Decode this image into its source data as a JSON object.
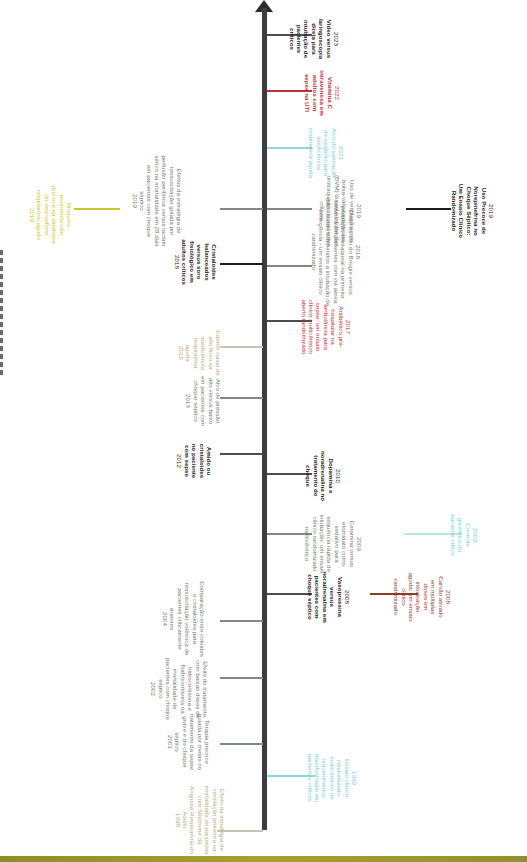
{
  "title_strip": "Linha do tempo (texto parcialmente cortado na margem esquerda)",
  "colors": {
    "axis": "#3d3d3f",
    "black_entry": "#1e1e22",
    "gray_entry": "#6f7a72",
    "yellow_entry": "#c9c72a",
    "cyan_entry": "#6fcfd3",
    "red_entry": "#c0303a",
    "brown_entry": "#8a3b2a",
    "tan_entry": "#b5ac7e",
    "footer_band": "#9a9a30"
  },
  "timeline": {
    "above": [
      {
        "year": "1998",
        "text": "Efeito da estratégia de ventilação protetora na mortalidade de pacientes com Síndrome da Angústia Respiratória do Adulto",
        "color": "tan"
      },
      {
        "year": "2001",
        "text": "Terapia precoce guiada por metas no tratamento da sepse grave e do choque séptico",
        "color": "gray"
      },
      {
        "year": "2002",
        "text": "Efeito do tratamento com baixas doses de hidrocortisona e fludrocortisona na mortalidade de pacientes com choque séptico",
        "color": "gray"
      },
      {
        "year": "2004",
        "text": "Comparação entre coloides e cristaloides para ressuscitação volêmica de pacientes criticamente doentes",
        "color": "gray"
      },
      {
        "year": "2012",
        "text": "Amido ou cristaloides no paciente com sepse",
        "color": "black"
      },
      {
        "year": "2014",
        "text": "Alvo de pressão alto versus baixo em pacientes com choque séptico",
        "color": "gray"
      },
      {
        "year": "2015",
        "text": "Cateter nasal de alto fluxo na insuficiência respiratória aguda",
        "color": "tan"
      },
      {
        "year": "2018",
        "text": "Cristaloides balanceados versus soro fisiológico em adultos críticos",
        "color": "black"
      },
      {
        "year": "2019",
        "text": "Efeitos da estratégia de ressuscitação guiada por perfusão periférica versus lactato sérico na mortalidade em 28 dias em pacientes com choque séptico",
        "color": "gray"
      },
      {
        "year": "2019",
        "text": "Bloqueio neuromuscular precoce na síndrome do desconforto respiratório agudo",
        "color": "yellow"
      }
    ],
    "below": [
      {
        "year": "1999",
        "text": "Ensaio clínico randomizado multicêntrico de requerimentos transfusionais em pacientes críticos",
        "color": "cyan"
      },
      {
        "year": "2008",
        "text": "Vasopressina versus noradrenalina em pacientes com choque séptico",
        "color": "black"
      },
      {
        "year": "2008",
        "text": "Carvão ativado em múltiplas doses em intoxicação aguda: um ensaio clínico randomizado",
        "color": "brown"
      },
      {
        "year": "2009",
        "text": "Cetamina versus etomidato como sedativo para sequência rápida de intubação: um ensaio clínico randomizado multicêntrico",
        "color": "gray"
      },
      {
        "year": "2009",
        "text": "Controle glicêmico do paciente crítico",
        "color": "cyan"
      },
      {
        "year": "2010",
        "text": "Dopamina e noradrenalina no tratamento do choque",
        "color": "black"
      },
      {
        "year": "2017",
        "text": "Antibiótico pré-hospitalar na ambulância para sepse: um ensaio clínico multicêntrico aberto randomizado",
        "color": "red"
      },
      {
        "year": "2018",
        "text": "Efeito do uso do Bougie versus intubação orotraqueal na primeira tentativa em pacientes com via aérea difícil sendo submetidos a intubação de emergência - um ensaio clínico randomizado",
        "color": "gray"
      },
      {
        "year": "2019",
        "text": "Uso de ventilação com bolsa-válvula-máscara (BVM) durante intubações orotraqueais de pacientes críticos",
        "color": "gray"
      },
      {
        "year": "2019",
        "text": "Uso Precoce de Norepinefrina no Choque Séptico: Um Ensaio Clínico Randomizado",
        "color": "black"
      },
      {
        "year": "2021",
        "text": "Alvo de saturação de oxigênio para insuficiência respiratória aguda",
        "color": "cyan"
      },
      {
        "year": "2022",
        "text": "Vitamina C intravenosa em adultos com sepse na UTI",
        "color": "red"
      },
      {
        "year": "2023",
        "text": "Vídeo versus laringoscopia direta para intubação de pacientes críticos",
        "color": "black"
      }
    ]
  }
}
